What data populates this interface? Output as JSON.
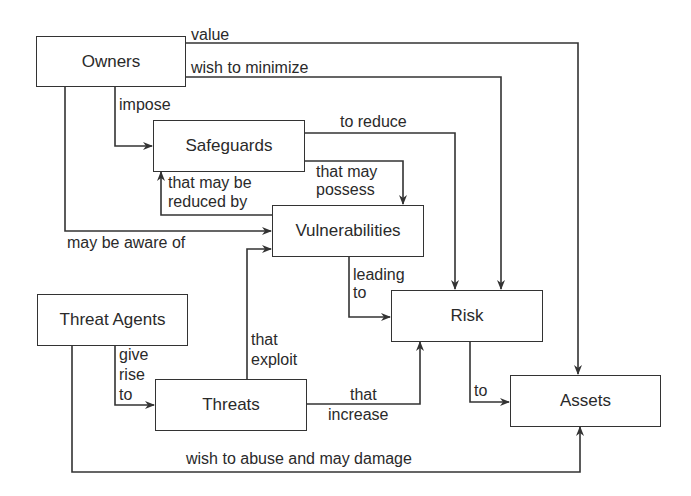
{
  "diagram": {
    "nodes": {
      "owners": "Owners",
      "safeguards": "Safeguards",
      "vulnerabilities": "Vulnerabilities",
      "risk": "Risk",
      "threat_agents": "Threat Agents",
      "threats": "Threats",
      "assets": "Assets"
    },
    "edges": {
      "value": "value",
      "wish_to_minimize": "wish to minimize",
      "impose": "impose",
      "to_reduce": "to reduce",
      "that_may_possess_1": "that may",
      "that_may_possess_2": "possess",
      "reduced_by_1": "that may be",
      "reduced_by_2": "reduced by",
      "may_be_aware_of": "may be aware of",
      "leading_to_1": "leading",
      "leading_to_2": "to",
      "give_rise_to_1": "give",
      "give_rise_to_2": "rise",
      "give_rise_to_3": "to",
      "that_exploit_1": "that",
      "that_exploit_2": "exploit",
      "that_increase_1": "that",
      "that_increase_2": "increase",
      "to": "to",
      "wish_to_abuse": "wish to abuse and may damage"
    },
    "colors": {
      "line": "#333333",
      "text": "#2a2a2a",
      "background": "#ffffff"
    }
  }
}
